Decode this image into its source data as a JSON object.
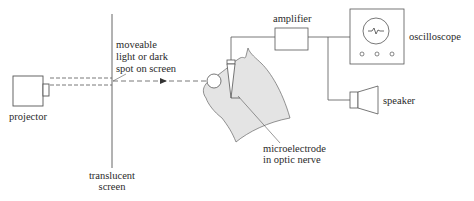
{
  "diagram": {
    "type": "experimental-setup",
    "components": [
      {
        "id": "projector",
        "label": "projector"
      },
      {
        "id": "screen",
        "label_lines": [
          "translucent",
          "screen"
        ]
      },
      {
        "id": "spot",
        "label_lines": [
          "moveable",
          "light or dark",
          "spot on screen"
        ]
      },
      {
        "id": "amplifier",
        "label": "amplifier"
      },
      {
        "id": "oscilloscope",
        "label": "oscilloscope"
      },
      {
        "id": "speaker",
        "label": "speaker"
      },
      {
        "id": "electrode",
        "label_lines": [
          "microelectrode",
          "in optic nerve"
        ]
      }
    ],
    "colors": {
      "line": "#555555",
      "cat_fill": "#e4e4e4",
      "text": "#2a2a2a"
    }
  }
}
